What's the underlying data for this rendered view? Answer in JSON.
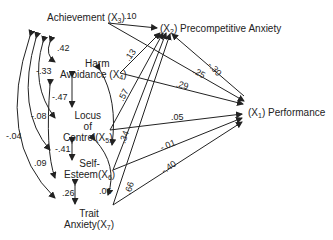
{
  "diagram": {
    "type": "path-analysis",
    "nodes": {
      "x1": {
        "name": "Performance",
        "var": "(X",
        "sub": "1",
        "close": ")"
      },
      "x2": {
        "name": "Precompetitive Anxiety",
        "var": "(X",
        "sub": "2",
        "close": ")"
      },
      "x3": {
        "name": "Achievement",
        "var": "(X",
        "sub": "3",
        "close": ")"
      },
      "x4": {
        "line1": "Harm",
        "line2": "Avoidance",
        "var": "(X",
        "sub": "4",
        "close": ")"
      },
      "x5": {
        "line1": "Locus",
        "line2": "of",
        "line3": "Control",
        "var": "(X",
        "sub": "5",
        "close": ")"
      },
      "x6": {
        "line1": "Self-",
        "line2": "Esteem",
        "var": "(X",
        "sub": "6",
        "close": ")"
      },
      "x7": {
        "line1": "Trait",
        "line2": "Anxiety",
        "var": "(X",
        "sub": "7",
        "close": ")"
      }
    },
    "paths_to_x2": [
      {
        "from": "X3",
        "coef": ".10"
      },
      {
        "from": "X4",
        "coef": ".13"
      },
      {
        "from": "X5",
        "coef": ".57"
      },
      {
        "from": "X6",
        "coef": ".34"
      },
      {
        "from": "X7",
        "coef": ".66"
      }
    ],
    "paths_to_x1": [
      {
        "from": "X3",
        "coef": ".25"
      },
      {
        "from": "X4",
        "coef": ".29"
      },
      {
        "from": "X5",
        "coef": ".05"
      },
      {
        "from": "X6",
        "coef": "-.01"
      },
      {
        "from": "X7",
        "coef": "-.40"
      },
      {
        "from": "X2",
        "coef": "-.30"
      }
    ],
    "correlations": [
      {
        "between": "X3-X4",
        "coef": ".42"
      },
      {
        "between": "X3-X5",
        "coef": "-.33"
      },
      {
        "between": "X3-X6",
        "coef": "-.08"
      },
      {
        "between": "X3-X7",
        "coef": "-.04"
      },
      {
        "between": "X4-X5",
        "coef": "-.47"
      },
      {
        "between": "X4-X7",
        "coef": ".09"
      },
      {
        "between": "X5-X6",
        "coef": "-.41"
      },
      {
        "between": "X6-X7",
        "coef": ".26"
      },
      {
        "between": "X5-X7",
        "coef": ".06"
      }
    ]
  }
}
